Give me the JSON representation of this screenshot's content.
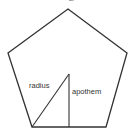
{
  "diagram": {
    "shape": "pentagon",
    "stroke_color": "#333333",
    "vertices": [
      [
        68,
        9
      ],
      [
        127,
        53
      ],
      [
        106,
        127
      ],
      [
        32,
        127
      ],
      [
        8,
        53
      ]
    ],
    "center": [
      69,
      74
    ],
    "labels": {
      "top": "Z",
      "radius": "radius",
      "apothem": "apothem"
    }
  }
}
